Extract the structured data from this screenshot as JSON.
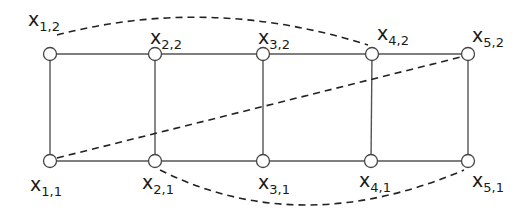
{
  "diagram": {
    "type": "graph",
    "colors": {
      "edge": "#555555",
      "node_stroke": "#444444",
      "node_fill": "#ffffff",
      "text": "#1a1a1a"
    },
    "nodes": [
      {
        "id": "x12",
        "var": "x",
        "sub": "1,2",
        "cx": 50,
        "cy": 54,
        "lx": 28,
        "ly": 26
      },
      {
        "id": "x22",
        "var": "x",
        "sub": "2,2",
        "cx": 155,
        "cy": 54,
        "lx": 150,
        "ly": 44
      },
      {
        "id": "x32",
        "var": "x",
        "sub": "3,2",
        "cx": 263,
        "cy": 54,
        "lx": 258,
        "ly": 44
      },
      {
        "id": "x42",
        "var": "x",
        "sub": "4,2",
        "cx": 372,
        "cy": 54,
        "lx": 377,
        "ly": 40
      },
      {
        "id": "x52",
        "var": "x",
        "sub": "5,2",
        "cx": 468,
        "cy": 54,
        "lx": 472,
        "ly": 42
      },
      {
        "id": "x11",
        "var": "x",
        "sub": "1,1",
        "cx": 50,
        "cy": 161,
        "lx": 30,
        "ly": 191
      },
      {
        "id": "x21",
        "var": "x",
        "sub": "2,1",
        "cx": 155,
        "cy": 161,
        "lx": 142,
        "ly": 189
      },
      {
        "id": "x31",
        "var": "x",
        "sub": "3,1",
        "cx": 263,
        "cy": 161,
        "lx": 258,
        "ly": 189
      },
      {
        "id": "x41",
        "var": "x",
        "sub": "4,1",
        "cx": 371,
        "cy": 161,
        "lx": 359,
        "ly": 187
      },
      {
        "id": "x51",
        "var": "x",
        "sub": "5,1",
        "cx": 468,
        "cy": 161,
        "lx": 472,
        "ly": 187
      }
    ],
    "solid_edges": [
      [
        "x12",
        "x22"
      ],
      [
        "x22",
        "x32"
      ],
      [
        "x32",
        "x42"
      ],
      [
        "x42",
        "x52"
      ],
      [
        "x11",
        "x21"
      ],
      [
        "x21",
        "x31"
      ],
      [
        "x31",
        "x41"
      ],
      [
        "x41",
        "x51"
      ],
      [
        "x12",
        "x11"
      ],
      [
        "x22",
        "x21"
      ],
      [
        "x32",
        "x31"
      ],
      [
        "x42",
        "x41"
      ],
      [
        "x52",
        "x51"
      ]
    ],
    "dashed_edges": [
      {
        "from": "x12",
        "to": "x42",
        "path": "M 57 35 Q 210 -5 368 45"
      },
      {
        "from": "x11",
        "to": "x52",
        "path": "M 57 158 L 461 57"
      },
      {
        "from": "x21",
        "to": "x51",
        "path": "M 160 170 Q 300 240 464 170"
      }
    ]
  }
}
